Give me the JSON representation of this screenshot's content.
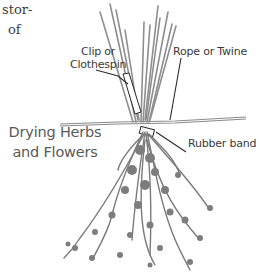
{
  "text_fragments": {
    "line1": "stor-",
    "line2": "of"
  },
  "title": {
    "line1": "Drying Herbs",
    "line2": "and Flowers"
  },
  "labels": {
    "clip_line1": "Clip or",
    "clip_line2": "Clothespin",
    "rope": "Rope or Twine",
    "rubber_band": "Rubber band"
  },
  "colors": {
    "stems": "#8a8a8a",
    "foliage": "#7a7a7a",
    "leader_lines": "#2a2a2a",
    "text": "#3a3a3a"
  }
}
